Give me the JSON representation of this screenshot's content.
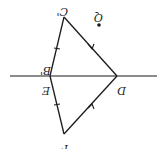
{
  "diagram": {
    "type": "geometry",
    "orientation": "rotated-180",
    "colors": {
      "line": "#1a1a1a",
      "background": "#ffffff"
    },
    "labels": {
      "c_prime": "C'",
      "q": "Q",
      "b_prime": "B'",
      "e": "E",
      "d": "D",
      "f": "F"
    },
    "points": {
      "C'": [
        64,
        17
      ],
      "Q": [
        99,
        24
      ],
      "B'": [
        50,
        76
      ],
      "E": [
        50,
        76
      ],
      "D": [
        117,
        76
      ],
      "F": [
        64,
        134
      ]
    },
    "segments": [
      {
        "from": "C'",
        "to": "B'",
        "mark": "single-tick"
      },
      {
        "from": "C'",
        "to": "D",
        "mark": "arrow"
      },
      {
        "from": "B'",
        "to": "D",
        "mark": "none"
      },
      {
        "from": "E",
        "to": "F",
        "mark": "single-tick"
      },
      {
        "from": "D",
        "to": "F",
        "mark": "arrow"
      }
    ],
    "line": {
      "from": [
        10,
        76
      ],
      "to": [
        157,
        76
      ]
    }
  }
}
